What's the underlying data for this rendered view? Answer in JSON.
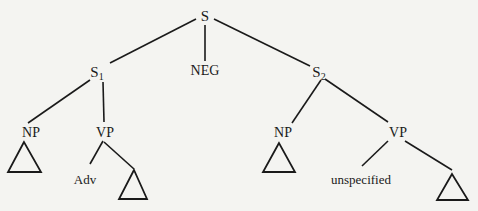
{
  "tree": {
    "root": {
      "label": "S"
    },
    "s1": {
      "label": "S",
      "sub": "1"
    },
    "neg": {
      "label": "NEG"
    },
    "s2": {
      "label": "S",
      "sub": "2"
    },
    "s1_np": {
      "label": "NP"
    },
    "s1_vp": {
      "label": "VP"
    },
    "s1_vp_adv": {
      "label": "Adv"
    },
    "s2_np": {
      "label": "NP"
    },
    "s2_vp": {
      "label": "VP"
    },
    "s2_vp_unspecified": {
      "label": "unspecified"
    }
  },
  "colors": {
    "ink": "#1a1a1a",
    "paper": "#f4f4f1"
  }
}
